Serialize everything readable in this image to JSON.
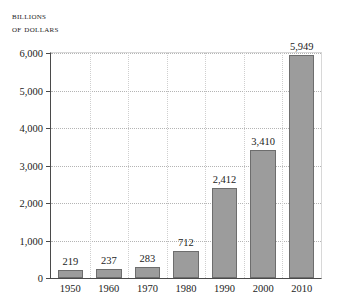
{
  "chart_data": {
    "type": "bar",
    "title": "Billions of dollars",
    "title_lines": [
      "Billions",
      "of dollars"
    ],
    "xlabel": "",
    "ylabel": "Billions of dollars",
    "categories": [
      "1950",
      "1960",
      "1970",
      "1980",
      "1990",
      "2000",
      "2010"
    ],
    "values": [
      219,
      237,
      283,
      712,
      2412,
      3410,
      5949
    ],
    "value_labels": [
      "219",
      "237",
      "283",
      "712",
      "2,412",
      "3,410",
      "5,949"
    ],
    "ylim": [
      0,
      6000
    ],
    "ytick_values": [
      0,
      1000,
      2000,
      3000,
      4000,
      5000,
      6000
    ],
    "ytick_labels": [
      "0",
      "1,000",
      "2,000",
      "3,000",
      "4,000",
      "5,000",
      "6,000"
    ],
    "grid": "both-dotted",
    "legend": "none",
    "bar_color": "#9c9c9c",
    "bar_edge_color": "#6d6d6d",
    "axis_color": "#4a4a4a",
    "grid_color": "#b4b4b4",
    "text_color": "#1c1c1c",
    "background": "#ffffff"
  }
}
